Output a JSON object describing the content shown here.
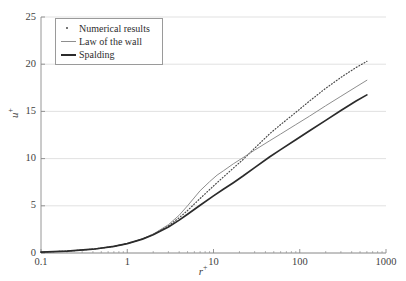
{
  "chart_data": {
    "type": "line",
    "title": "",
    "xlabel": "r+",
    "ylabel": "u+",
    "xscale": "log",
    "yscale": "linear",
    "xlim": [
      0.1,
      1000
    ],
    "ylim": [
      0,
      25
    ],
    "grid": true,
    "grid_axis": "y",
    "legend_position": "upper left",
    "xticks": [
      "0.1",
      "1",
      "10",
      "100",
      "1000"
    ],
    "xtick_values": [
      0.1,
      1,
      10,
      100,
      1000
    ],
    "yticks": [
      "0",
      "5",
      "10",
      "15",
      "20",
      "25"
    ],
    "ytick_values": [
      0,
      5,
      10,
      15,
      20,
      25
    ],
    "series": [
      {
        "name": "Numerical results",
        "style": "dotted",
        "color": "#4a4a4a",
        "x": [
          0.1,
          0.2,
          0.4,
          0.7,
          1.0,
          1.5,
          2.0,
          3.0,
          4.0,
          5.0,
          7.0,
          10.0,
          13.0,
          17.0,
          22.0,
          30.0,
          45.0,
          60.0,
          90.0,
          130.0,
          200.0,
          300.0,
          450.0,
          600.0
        ],
        "y": [
          0.1,
          0.2,
          0.4,
          0.7,
          1.0,
          1.49,
          1.97,
          2.88,
          3.73,
          4.5,
          5.78,
          7.1,
          8.05,
          9.0,
          9.9,
          11.1,
          12.65,
          13.6,
          14.9,
          16.1,
          17.45,
          18.6,
          19.65,
          20.3
        ]
      },
      {
        "name": "Law of the wall",
        "style": "solid-thin",
        "color": "#8e8e8e",
        "x": [
          0.1,
          0.2,
          0.4,
          0.7,
          1.0,
          1.5,
          2.0,
          3.0,
          4.0,
          5.0,
          7.0,
          9.0,
          11.0,
          13.0,
          17.0,
          22.0,
          30.0,
          45.0,
          60.0,
          90.0,
          130.0,
          200.0,
          300.0,
          450.0,
          600.0
        ],
        "y": [
          0.1,
          0.2,
          0.4,
          0.7,
          1.0,
          1.5,
          2.0,
          3.0,
          4.0,
          5.0,
          6.6,
          7.55,
          8.25,
          8.7,
          9.45,
          10.1,
          10.9,
          11.9,
          12.6,
          13.6,
          14.5,
          15.6,
          16.6,
          17.6,
          18.3
        ]
      },
      {
        "name": "Spalding",
        "style": "solid-thick",
        "color": "#2b2b2b",
        "x": [
          0.1,
          0.2,
          0.4,
          0.7,
          1.0,
          1.5,
          2.0,
          3.0,
          4.0,
          5.0,
          7.0,
          10.0,
          13.0,
          17.0,
          22.0,
          30.0,
          45.0,
          60.0,
          90.0,
          130.0,
          200.0,
          300.0,
          450.0,
          600.0
        ],
        "y": [
          0.1,
          0.2,
          0.4,
          0.7,
          0.99,
          1.47,
          1.93,
          2.76,
          3.48,
          4.1,
          5.06,
          6.05,
          6.75,
          7.45,
          8.15,
          9.05,
          10.2,
          10.95,
          12.0,
          12.95,
          14.05,
          15.1,
          16.1,
          16.75
        ]
      }
    ]
  },
  "legend": {
    "items": [
      {
        "label": "Numerical results",
        "key": "dot-marker"
      },
      {
        "label": "Law of the wall",
        "key": "thin-line"
      },
      {
        "label": "Spalding",
        "key": "thick-line"
      }
    ]
  },
  "axes": {
    "x_label_base": "r",
    "x_label_sup": "+",
    "y_label_base": "u",
    "y_label_sup": "+"
  },
  "colors": {
    "grid": "#d9d9d9",
    "axis": "#8a8a8a",
    "numerical": "#4a4a4a",
    "law_of_wall": "#8e8e8e",
    "spalding": "#2b2b2b",
    "text": "#3f3f3f"
  }
}
